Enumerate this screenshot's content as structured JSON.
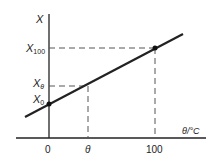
{
  "diagram": {
    "type": "linear calibration graph",
    "y_axis_label": "X",
    "x_axis_label": "θ/°C",
    "y_ticks": [
      {
        "label": "X",
        "sub": "100"
      },
      {
        "label": "X",
        "sub": "θ"
      },
      {
        "label": "X",
        "sub": "0"
      }
    ],
    "x_ticks": [
      "0",
      "θ",
      "100"
    ],
    "points": [
      {
        "name": "X0",
        "x_label": "0",
        "y_label": "X0"
      },
      {
        "name": "X100",
        "x_label": "100",
        "y_label": "X100"
      }
    ],
    "colors": {
      "line": "#222222",
      "dash": "#555555",
      "background": "#ffffff"
    }
  }
}
